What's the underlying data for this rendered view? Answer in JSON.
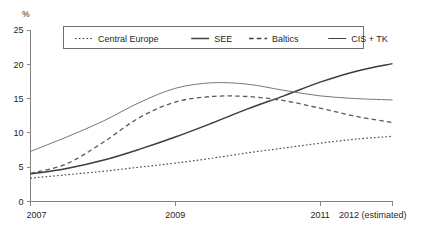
{
  "chart_data": {
    "type": "line",
    "title": "",
    "subtitle": "",
    "xlabel": "",
    "ylabel": "%",
    "unit_label": "%",
    "xlim": [
      2007,
      2012
    ],
    "ylim": [
      0,
      25
    ],
    "ytick_values": [
      0,
      5,
      10,
      15,
      20,
      25
    ],
    "ytick_labels": [
      "0",
      "5",
      "10",
      "15",
      "20",
      "25"
    ],
    "xtick_values": [
      2007,
      2009,
      2011,
      2012
    ],
    "xtick_labels": [
      "2007",
      "2009",
      "2011",
      "2012 (estimated)"
    ],
    "grid": false,
    "legend_position": "top-center",
    "x": [
      2007,
      2007.5,
      2008,
      2008.5,
      2009,
      2009.5,
      2010,
      2010.5,
      2011,
      2011.5,
      2012
    ],
    "series": [
      {
        "name": "Central Europe",
        "style": "dotted",
        "color": "#4a4a4a",
        "values": [
          3.4,
          3.9,
          4.4,
          5.0,
          5.6,
          6.3,
          7.1,
          7.8,
          8.5,
          9.1,
          9.5
        ]
      },
      {
        "name": "SEE",
        "style": "solid",
        "color": "#3c3c3c",
        "values": [
          4.0,
          4.8,
          6.0,
          7.6,
          9.4,
          11.4,
          13.5,
          15.4,
          17.4,
          19.0,
          20.1
        ]
      },
      {
        "name": "Baltics",
        "style": "dashed",
        "color": "#5a5a5a",
        "values": [
          4.1,
          5.5,
          8.6,
          12.2,
          14.5,
          15.3,
          15.3,
          14.7,
          13.6,
          12.4,
          11.5
        ]
      },
      {
        "name": "CIS + TK",
        "style": "solid-thin",
        "color": "#777777",
        "values": [
          7.3,
          9.4,
          11.7,
          14.4,
          16.5,
          17.3,
          17.1,
          16.2,
          15.4,
          15.0,
          14.8
        ]
      }
    ],
    "legend_entries": [
      {
        "label": "Central Europe",
        "style": "dotted"
      },
      {
        "label": "SEE",
        "style": "solid"
      },
      {
        "label": "Baltics",
        "style": "dashed"
      },
      {
        "label": "CIS + TK",
        "style": "solid-thin"
      }
    ]
  }
}
